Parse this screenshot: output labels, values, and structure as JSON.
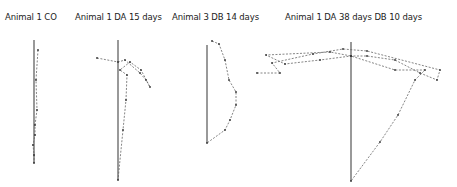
{
  "figure": {
    "panels": [
      {
        "title": "Animal 1  CO",
        "ref_line": [
          34,
          40,
          34,
          163
        ],
        "trace": [
          [
            38,
            50
          ],
          [
            36,
            80
          ],
          [
            37,
            110
          ],
          [
            35,
            125
          ],
          [
            35,
            135
          ],
          [
            33,
            145
          ],
          [
            34,
            155
          ],
          [
            34,
            163
          ]
        ]
      },
      {
        "title": "Animal 1  DA  15 days",
        "ref_line": [
          118,
          40,
          118,
          180
        ],
        "trace": [
          [
            97,
            58
          ],
          [
            118,
            62
          ],
          [
            125,
            60
          ],
          [
            140,
            73
          ],
          [
            146,
            80
          ],
          [
            150,
            87
          ],
          [
            141,
            70
          ],
          [
            130,
            62
          ],
          [
            120,
            70
          ],
          [
            127,
            75
          ],
          [
            126,
            100
          ],
          [
            123,
            130
          ],
          [
            118,
            180
          ]
        ]
      },
      {
        "title": "Animal  3  DB  14 days",
        "ref_line": [
          207,
          45,
          207,
          143
        ],
        "trace": [
          [
            212,
            41
          ],
          [
            219,
            44
          ],
          [
            225,
            60
          ],
          [
            229,
            80
          ],
          [
            236,
            92
          ],
          [
            236,
            105
          ],
          [
            230,
            120
          ],
          [
            225,
            130
          ],
          [
            207,
            143
          ]
        ]
      },
      {
        "title": "Animal  1  DA  38 days  DB  10 days",
        "ref_line": [
          351,
          42,
          351,
          181
        ],
        "trace": [
          [
            257,
            73
          ],
          [
            280,
            73
          ],
          [
            272,
            63
          ],
          [
            313,
            54
          ],
          [
            343,
            49
          ],
          [
            367,
            51
          ],
          [
            440,
            70
          ],
          [
            437,
            80
          ],
          [
            420,
            73
          ],
          [
            395,
            60
          ],
          [
            367,
            56
          ],
          [
            351,
            56
          ],
          [
            320,
            60
          ],
          [
            285,
            64
          ],
          [
            266,
            55
          ],
          [
            330,
            52
          ],
          [
            351,
            56
          ],
          [
            395,
            70
          ],
          [
            425,
            70
          ],
          [
            415,
            80
          ],
          [
            398,
            115
          ],
          [
            380,
            142
          ],
          [
            351,
            181
          ]
        ]
      }
    ]
  }
}
